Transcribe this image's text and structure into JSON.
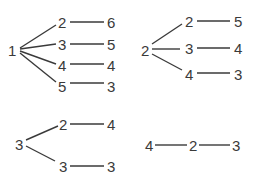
{
  "diagram": {
    "type": "tree-diagram",
    "colors": {
      "line": "#3a3a3a",
      "text": "#3a3a3a",
      "background": "#ffffff"
    },
    "trees": [
      {
        "root": "1",
        "branches": [
          {
            "child": "2",
            "leaf": "6"
          },
          {
            "child": "3",
            "leaf": "5"
          },
          {
            "child": "4",
            "leaf": "4"
          },
          {
            "child": "5",
            "leaf": "3"
          }
        ]
      },
      {
        "root": "2",
        "branches": [
          {
            "child": "2",
            "leaf": "5"
          },
          {
            "child": "3",
            "leaf": "4"
          },
          {
            "child": "4",
            "leaf": "3"
          }
        ]
      },
      {
        "root": "3",
        "branches": [
          {
            "child": "2",
            "leaf": "4"
          },
          {
            "child": "3",
            "leaf": "3"
          }
        ]
      },
      {
        "root": "4",
        "branches": [
          {
            "child": "2",
            "leaf": "3"
          }
        ]
      }
    ]
  }
}
